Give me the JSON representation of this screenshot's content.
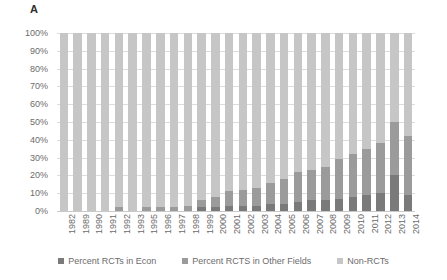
{
  "panel": {
    "label": "A"
  },
  "axis": {
    "y_ticks": [
      "100%",
      "90%",
      "80%",
      "70%",
      "60%",
      "50%",
      "40%",
      "30%",
      "20%",
      "10%",
      "0%"
    ]
  },
  "legend": {
    "items": [
      {
        "label": "Percent RCTs in Econ",
        "color": "#7a7a7a"
      },
      {
        "label": "Percent RCTS in Other Fields",
        "color": "#9b9b9b"
      },
      {
        "label": "Non-RCTs",
        "color": "#c6c6c6"
      }
    ]
  },
  "chart_data": {
    "type": "bar",
    "title": "A",
    "xlabel": "",
    "ylabel": "",
    "ylim": [
      0,
      100
    ],
    "stacked": true,
    "normalized_percent": true,
    "grid": true,
    "legend_position": "bottom",
    "categories": [
      "1982",
      "1989",
      "1990",
      "1991",
      "1992",
      "1993",
      "1995",
      "1996",
      "1997",
      "1998",
      "1999",
      "2000",
      "2001",
      "2002",
      "2003",
      "2004",
      "2005",
      "2006",
      "2007",
      "2008",
      "2009",
      "2010",
      "2011",
      "2012",
      "2013",
      "2014"
    ],
    "series": [
      {
        "name": "Percent RCTs in Econ",
        "color": "#7a7a7a",
        "values": [
          0,
          0,
          0,
          0,
          0,
          0,
          0,
          0,
          0,
          0,
          2,
          2,
          3,
          3,
          3,
          4,
          4,
          5,
          6,
          6,
          7,
          8,
          9,
          10,
          20,
          9
        ]
      },
      {
        "name": "Percent RCTS in Other Fields",
        "color": "#9b9b9b",
        "values": [
          0,
          0,
          0,
          0,
          2,
          0,
          2,
          2,
          2,
          3,
          4,
          6,
          8,
          9,
          10,
          12,
          14,
          17,
          17,
          19,
          22,
          24,
          26,
          28,
          30,
          33
        ]
      },
      {
        "name": "Non-RCTs",
        "color": "#c6c6c6",
        "values": [
          100,
          100,
          100,
          100,
          98,
          100,
          98,
          98,
          98,
          97,
          94,
          92,
          89,
          88,
          87,
          84,
          82,
          78,
          77,
          75,
          71,
          68,
          65,
          62,
          50,
          58
        ]
      }
    ]
  }
}
